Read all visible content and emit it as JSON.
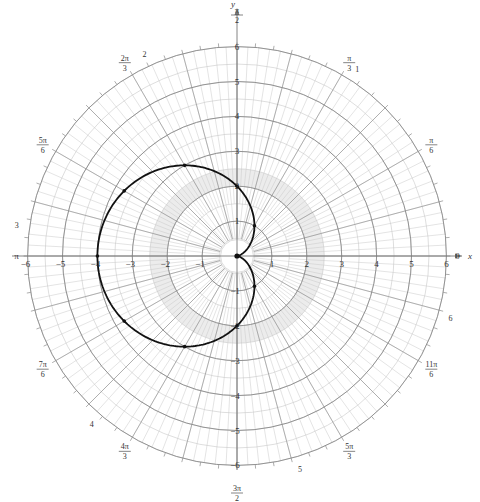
{
  "chart_data": {
    "type": "line",
    "subtype": "polar",
    "title": "",
    "equation": "r = 2 - 2cos(θ)",
    "curve_name": "cardioid",
    "xlabel": "x",
    "ylabel": "y",
    "theta_label": "θ",
    "r_max": 6,
    "grid": true,
    "rings": [
      1,
      2,
      3,
      4,
      5,
      6
    ],
    "x_tick_labels": [
      "-6",
      "-5",
      "-4",
      "-3",
      "-2",
      "-1",
      "1",
      "2",
      "3",
      "4",
      "5",
      "6"
    ],
    "y_tick_labels": [
      "-6",
      "-5",
      "-4",
      "-3",
      "-2",
      "-1",
      "1",
      "2",
      "3",
      "4",
      "5",
      "6"
    ],
    "angle_labels": [
      {
        "angle_deg": 0,
        "num": "0",
        "den": ""
      },
      {
        "angle_deg": 30,
        "num": "π",
        "den": "6"
      },
      {
        "angle_deg": 60,
        "num": "π",
        "den": "3"
      },
      {
        "angle_deg": 90,
        "num": "π",
        "den": "2"
      },
      {
        "angle_deg": 120,
        "num": "2π",
        "den": "3"
      },
      {
        "angle_deg": 150,
        "num": "5π",
        "den": "6"
      },
      {
        "angle_deg": 180,
        "num": "π",
        "den": ""
      },
      {
        "angle_deg": 210,
        "num": "7π",
        "den": "6"
      },
      {
        "angle_deg": 240,
        "num": "4π",
        "den": "3"
      },
      {
        "angle_deg": 270,
        "num": "3π",
        "den": "2"
      },
      {
        "angle_deg": 300,
        "num": "5π",
        "den": "3"
      },
      {
        "angle_deg": 330,
        "num": "11π",
        "den": "6"
      }
    ],
    "radian_ring_labels": [
      "1",
      "2",
      "3",
      "4",
      "5",
      "6"
    ],
    "points": [
      {
        "theta": "0",
        "r": 0,
        "x": 0,
        "y": 0
      },
      {
        "theta": "π/3",
        "r": 1,
        "x": 0.5,
        "y": 0.866
      },
      {
        "theta": "π/2",
        "r": 2,
        "x": 0,
        "y": 2
      },
      {
        "theta": "2π/3",
        "r": 3,
        "x": -1.5,
        "y": 2.598
      },
      {
        "theta": "5π/6",
        "r": 3.732,
        "x": -3.232,
        "y": 1.866
      },
      {
        "theta": "π",
        "r": 4,
        "x": -4,
        "y": 0
      },
      {
        "theta": "7π/6",
        "r": 3.732,
        "x": -3.232,
        "y": -1.866
      },
      {
        "theta": "4π/3",
        "r": 3,
        "x": -1.5,
        "y": -2.598
      },
      {
        "theta": "3π/2",
        "r": 2,
        "x": 0,
        "y": -2
      },
      {
        "theta": "5π/3",
        "r": 1,
        "x": 0.5,
        "y": -0.866
      },
      {
        "theta": "2π",
        "r": 0,
        "x": 0,
        "y": 0
      }
    ],
    "colors": {
      "curve": "#111111",
      "grid_major": "#8a8a8a",
      "grid_minor": "#c8c8c8",
      "axis": "#777777"
    }
  }
}
